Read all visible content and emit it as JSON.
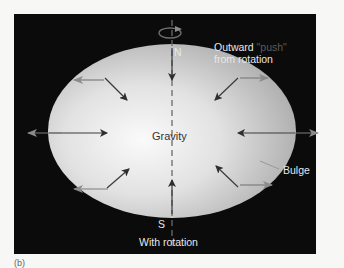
{
  "figure": {
    "label": "(b)",
    "caption": "With rotation",
    "colors": {
      "background": "#0b0b0b",
      "planet_light": "#f2f2f2",
      "planet_dark": "#9a9a9a",
      "arrow_gravity": "#3a3a3a",
      "arrow_outward": "#8a8a8a",
      "text": "#e8e8e8"
    }
  },
  "labels": {
    "north": "N",
    "south": "S",
    "gravity": "Gravity",
    "outward_prefix": "Outward ",
    "outward_push": "\"push\"",
    "outward_line2": "from rotation",
    "bulge": "Bulge",
    "with_rotation": "With rotation"
  },
  "icons": {
    "rotation": "rotation-arrow-icon",
    "gravity_arrows": "gravity-arrow-icon",
    "outward_arrows": "outward-arrow-icon"
  }
}
